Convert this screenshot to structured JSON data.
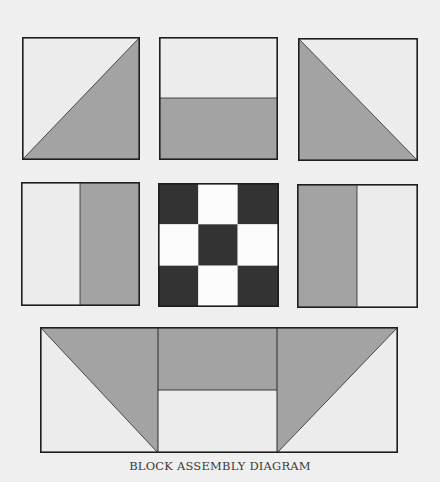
{
  "caption": "BLOCK ASSEMBLY DIAGRAM",
  "colors": {
    "background": "#efefef",
    "light_fabric": "#ececec",
    "medium_fabric": "#a3a3a3",
    "dark_fabric": "#333333",
    "white_fabric": "#fcfcfc",
    "outline": "#1e1e1e"
  },
  "blocks": [
    {
      "id": "top-left",
      "type": "half-square-triangle",
      "row": 1,
      "col": 1,
      "shaded": "lower-right"
    },
    {
      "id": "top-center",
      "type": "horizontal-split",
      "row": 1,
      "col": 2,
      "shaded": "bottom"
    },
    {
      "id": "top-right",
      "type": "half-square-triangle",
      "row": 1,
      "col": 3,
      "shaded": "lower-left"
    },
    {
      "id": "middle-left",
      "type": "vertical-split",
      "row": 2,
      "col": 1,
      "shaded": "right"
    },
    {
      "id": "middle-center",
      "type": "nine-patch",
      "row": 2,
      "col": 2,
      "pattern": "dark corners and center"
    },
    {
      "id": "middle-right",
      "type": "vertical-split",
      "row": 2,
      "col": 3,
      "shaded": "left"
    },
    {
      "id": "bottom-strip",
      "type": "flying-geese-strip",
      "row": 3,
      "sections": [
        "left triangle",
        "center horizontal split",
        "right triangle"
      ]
    }
  ]
}
